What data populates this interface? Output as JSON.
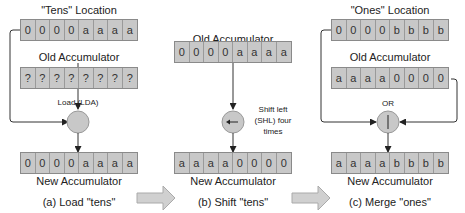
{
  "panels": [
    {
      "id": "a",
      "top_label": "\"Tens\" Location",
      "top_bits": [
        "0",
        "0",
        "0",
        "0",
        "a",
        "a",
        "a",
        "a"
      ],
      "mid_label": "Old Accumulator",
      "mid_bits": [
        "?",
        "?",
        "?",
        "?",
        "?",
        "?",
        "?",
        "?"
      ],
      "op_label": "Load (LDA)",
      "op_icon": "load-circle-icon",
      "bottom_bits": [
        "0",
        "0",
        "0",
        "0",
        "a",
        "a",
        "a",
        "a"
      ],
      "bottom_label": "New Accumulator",
      "caption": "(a) Load \"tens\""
    },
    {
      "id": "b",
      "mid_label": "Old Accumulator",
      "mid_bits": [
        "0",
        "0",
        "0",
        "0",
        "a",
        "a",
        "a",
        "a"
      ],
      "op_label_lines": [
        "Shift left",
        "(SHL) four",
        "times"
      ],
      "op_icon": "shift-left-arrow-icon",
      "bottom_bits": [
        "a",
        "a",
        "a",
        "a",
        "0",
        "0",
        "0",
        "0"
      ],
      "bottom_label": "New Accumulator",
      "caption": "(b) Shift \"tens\""
    },
    {
      "id": "c",
      "top_label": "\"Ones\" Location",
      "top_bits": [
        "0",
        "0",
        "0",
        "0",
        "b",
        "b",
        "b",
        "b"
      ],
      "mid_label": "Old Accumulator",
      "mid_bits": [
        "a",
        "a",
        "a",
        "a",
        "0",
        "0",
        "0",
        "0"
      ],
      "op_label": "OR",
      "op_icon": "or-bar-icon",
      "bottom_bits": [
        "a",
        "a",
        "a",
        "a",
        "b",
        "b",
        "b",
        "b"
      ],
      "bottom_label": "New Accumulator",
      "caption": "(c) Merge \"ones\""
    }
  ],
  "colors": {
    "cell_fill": "#c8c8c8",
    "cell_border": "#8a8a8a",
    "circle_fill": "#c8c8c8",
    "block_arrow_fill": "#d0d0d0",
    "line": "#333333"
  }
}
